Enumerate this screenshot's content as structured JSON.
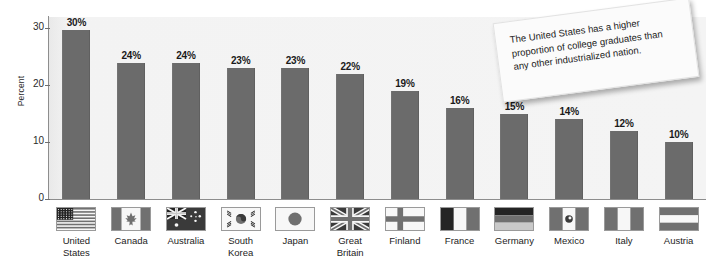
{
  "chart_data": {
    "type": "bar",
    "title": "",
    "xlabel": "",
    "ylabel": "Percent",
    "ylim": [
      0,
      32
    ],
    "yticks": [
      0,
      10,
      20,
      30
    ],
    "grid": false,
    "legend": "none",
    "categories": [
      "United States",
      "Canada",
      "Australia",
      "South Korea",
      "Japan",
      "Great Britain",
      "Finland",
      "France",
      "Germany",
      "Mexico",
      "Italy",
      "Austria"
    ],
    "values": [
      30,
      24,
      24,
      23,
      23,
      22,
      19,
      16,
      15,
      14,
      12,
      10
    ],
    "data_labels": [
      "30%",
      "24%",
      "24%",
      "23%",
      "23%",
      "22%",
      "19%",
      "16%",
      "15%",
      "14%",
      "12%",
      "10%"
    ],
    "category_icons": [
      "flag-united-states",
      "flag-canada",
      "flag-australia",
      "flag-south-korea",
      "flag-japan",
      "flag-great-britain",
      "flag-finland",
      "flag-france",
      "flag-germany",
      "flag-mexico",
      "flag-italy",
      "flag-austria"
    ],
    "annotations": [
      {
        "name": "callout-note",
        "text": "The United States has a higher proportion of college graduates than any other industrialized nation."
      }
    ],
    "colors": {
      "bar": "#6b6b6b",
      "plot_background": "#f3f3f3",
      "axis": "#8d8d8d",
      "text": "#1d1d1d",
      "note_background": "#fbfbfb"
    }
  },
  "axis": {
    "ylabel": "Percent",
    "ticks": [
      "30",
      "20",
      "10",
      "0"
    ]
  },
  "labels": {
    "united_states_line1": "United",
    "united_states_line2": "States",
    "canada": "Canada",
    "australia": "Australia",
    "south_korea_line1": "South",
    "south_korea_line2": "Korea",
    "japan": "Japan",
    "great_britain_line1": "Great",
    "great_britain_line2": "Britain",
    "finland": "Finland",
    "france": "France",
    "germany": "Germany",
    "mexico": "Mexico",
    "italy": "Italy",
    "austria": "Austria"
  },
  "note": {
    "text": "The United States has a higher proportion of college graduates than any other industrialized nation."
  }
}
